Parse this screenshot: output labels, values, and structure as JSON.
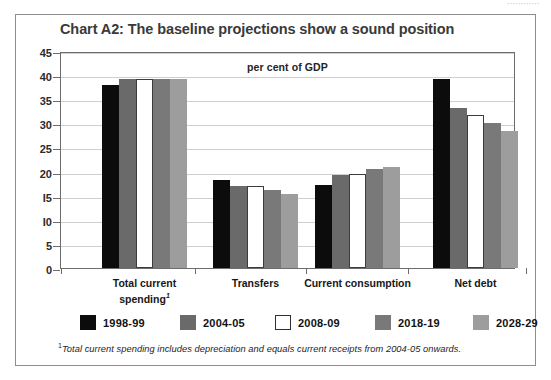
{
  "scan_artifact": {
    "text": "············"
  },
  "chart_data": {
    "type": "bar",
    "title": "Chart A2: The baseline projections show a sound position",
    "subtitle": "per cent of GDP",
    "xlabel": "",
    "ylabel": "",
    "ylim": [
      0,
      45
    ],
    "yticks": [
      0,
      5,
      10,
      15,
      20,
      25,
      30,
      35,
      40,
      45
    ],
    "ytick_labels": [
      "0",
      "5",
      "I0",
      "I5",
      "20",
      "25",
      "30",
      "35",
      "40",
      "45"
    ],
    "grid": true,
    "legend_position": "bottom",
    "categories": [
      "Total current spending",
      "Transfers",
      "Current consumption",
      "Net debt"
    ],
    "category_labels": [
      [
        "Total current",
        "spending"
      ],
      [
        "Transfers"
      ],
      [
        "Current consumption"
      ],
      [
        "Net debt"
      ]
    ],
    "category_footnote_marker": [
      true,
      false,
      false,
      false
    ],
    "series": [
      {
        "name": "1998-99",
        "color": "#0c0c0c",
        "values": [
          38.0,
          18.2,
          17.3,
          39.3
        ]
      },
      {
        "name": "2004-05",
        "color": "#6a6a6a",
        "values": [
          39.3,
          17.0,
          19.3,
          33.2
        ]
      },
      {
        "name": "2008-09",
        "color": "#ffffff",
        "values": [
          39.3,
          17.0,
          19.6,
          31.8
        ]
      },
      {
        "name": "2018-19",
        "color": "#797979",
        "values": [
          39.3,
          16.2,
          20.5,
          30.0
        ]
      },
      {
        "name": "2028-29",
        "color": "#9d9d9d",
        "values": [
          39.3,
          15.4,
          21.0,
          28.5
        ]
      }
    ],
    "footnote": "Total current spending includes depreciation and equals current receipts from 2004-05 onwards.",
    "footnote_marker": "1"
  },
  "colors": {
    "frame": "#8d8d8d",
    "plot_border": "#6d6d6d",
    "gridline": "#cfcfcf",
    "title_text": "#3a3a3a",
    "body_text": "#171717"
  }
}
